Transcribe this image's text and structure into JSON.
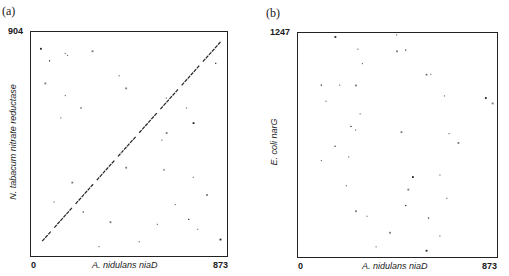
{
  "chart_data": [
    {
      "type": "scatter",
      "panel": "(a)",
      "title": "",
      "xlabel": "A. nidulans niaD",
      "ylabel": "N. tabacum nitrate reductase",
      "x_ticks": [
        "0",
        "873"
      ],
      "y_ticks": [
        "904"
      ],
      "xlim": [
        0,
        873
      ],
      "ylim": [
        0,
        904
      ],
      "description": "Dot matrix (dot plot) comparison; strong diagonal line of matches from lower-left (~x 50, y 60) to upper-right (~x 860, y 880) indicating sequence homology, plus scattered background dots",
      "diagonal": {
        "x": [
          50,
          860
        ],
        "y": [
          60,
          880
        ]
      },
      "points": [
        [
          40,
          840
        ],
        [
          150,
          820
        ],
        [
          160,
          812
        ],
        [
          270,
          830
        ],
        [
          80,
          790
        ],
        [
          390,
          730
        ],
        [
          60,
          700
        ],
        [
          150,
          650
        ],
        [
          220,
          600
        ],
        [
          420,
          680
        ],
        [
          600,
          640
        ],
        [
          690,
          600
        ],
        [
          720,
          540
        ],
        [
          580,
          470
        ],
        [
          400,
          420
        ],
        [
          420,
          360
        ],
        [
          590,
          350
        ],
        [
          720,
          320
        ],
        [
          780,
          250
        ],
        [
          100,
          220
        ],
        [
          230,
          180
        ],
        [
          350,
          140
        ],
        [
          560,
          130
        ],
        [
          740,
          110
        ],
        [
          840,
          70
        ],
        [
          300,
          40
        ],
        [
          480,
          60
        ],
        [
          600,
          500
        ],
        [
          820,
          780
        ],
        [
          130,
          560
        ],
        [
          180,
          300
        ],
        [
          640,
          210
        ],
        [
          700,
          150
        ]
      ]
    },
    {
      "type": "scatter",
      "panel": "(b)",
      "title": "",
      "xlabel": "A. nidulans niaD",
      "ylabel": "E. coli narG",
      "x_ticks": [
        "0",
        "873"
      ],
      "y_ticks": [
        "1247"
      ],
      "xlim": [
        0,
        873
      ],
      "ylim": [
        0,
        1247
      ],
      "description": "Dot matrix comparison with only scattered random dots; no diagonal, indicating no significant homology",
      "points": [
        [
          160,
          1230
        ],
        [
          430,
          1240
        ],
        [
          260,
          1160
        ],
        [
          430,
          1150
        ],
        [
          470,
          1155
        ],
        [
          280,
          1080
        ],
        [
          560,
          1020
        ],
        [
          580,
          1020
        ],
        [
          100,
          960
        ],
        [
          250,
          960
        ],
        [
          180,
          960
        ],
        [
          640,
          900
        ],
        [
          820,
          890
        ],
        [
          120,
          870
        ],
        [
          270,
          800
        ],
        [
          850,
          860
        ],
        [
          230,
          730
        ],
        [
          250,
          710
        ],
        [
          450,
          700
        ],
        [
          660,
          690
        ],
        [
          160,
          620
        ],
        [
          700,
          640
        ],
        [
          100,
          540
        ],
        [
          220,
          560
        ],
        [
          500,
          450
        ],
        [
          620,
          460
        ],
        [
          210,
          400
        ],
        [
          480,
          380
        ],
        [
          470,
          290
        ],
        [
          650,
          330
        ],
        [
          250,
          260
        ],
        [
          300,
          230
        ],
        [
          570,
          220
        ],
        [
          400,
          140
        ],
        [
          620,
          120
        ],
        [
          340,
          60
        ],
        [
          560,
          40
        ]
      ]
    }
  ],
  "panels": {
    "a": {
      "label": "(a)",
      "y_max": "904",
      "x_min": "0",
      "x_max": "873",
      "xlabel": "A. nidulans  niaD",
      "ylabel": "N. tabacum nitrate reductase"
    },
    "b": {
      "label": "(b)",
      "y_max": "1247",
      "x_min": "0",
      "x_max": "873",
      "xlabel": "A. nidulans  niaD",
      "ylabel": "E. coli narG"
    }
  }
}
